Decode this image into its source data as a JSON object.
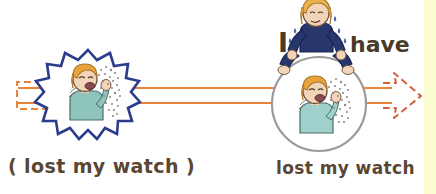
{
  "figure": {
    "background_color": "#ffffff",
    "width": 436,
    "height": 194
  },
  "captions": {
    "left": "( lost my watch )",
    "right": "lost my watch",
    "text_color": "#5a4632"
  },
  "speech": {
    "word_subject": "I",
    "word_verb": "have",
    "text_color": "#4a3a28"
  },
  "shapes": {
    "starburst": {
      "name": "starburst",
      "stroke": "#2b3c8c",
      "fill": "#ffffff",
      "center_x": 88,
      "center_y": 96,
      "outer_radius": 46,
      "inner_radius": 33,
      "points": 14
    },
    "circle": {
      "name": "thought-bubble-circle",
      "stroke": "#9a9a9a",
      "fill": "#ffffff",
      "center_x": 319,
      "center_y": 104,
      "radius": 47
    },
    "connector_lines": {
      "name": "connector-lines",
      "stroke": "#e8833a",
      "count": 2,
      "y_top": 88,
      "y_bottom": 103,
      "x_start": 17,
      "x_end": 392
    },
    "left_bracket": {
      "name": "dashed-open-rectangle",
      "stroke": "#e8833a",
      "x": 17,
      "y": 82,
      "width": 36,
      "height": 27,
      "dashed": true
    },
    "right_arrow": {
      "name": "dashed-arrow-right",
      "stroke": "#d4613c",
      "tip_x": 420,
      "tip_y": 96,
      "dashed": true
    },
    "right_strip": {
      "name": "yellow-edge-strip",
      "color": "#fdfdd2",
      "x": 424,
      "width": 12
    }
  },
  "characters": {
    "sneezing_left": {
      "name": "sneezing-person-in-starburst",
      "hair_color": "#e8a33d",
      "skin_color": "#f2d5b8",
      "shirt_color": "#8fc4bd",
      "spray_color": "#8a8a8a",
      "outline_color": "#4a4a4a"
    },
    "sneezing_right": {
      "name": "sneezing-person-in-circle",
      "hair_color": "#e8a33d",
      "skin_color": "#f2d5b8",
      "shirt_color": "#9fd0cc",
      "spray_color": "#8a8a8a",
      "outline_color": "#4a4a4a"
    },
    "speaker_top": {
      "name": "speaking-person-on-top",
      "hair_color": "#e8b44a",
      "skin_color": "#f2d5b8",
      "sweater_color": "#28366e",
      "sweat_color": "#4a6aa0",
      "outline_color": "#3a3a3a"
    }
  }
}
